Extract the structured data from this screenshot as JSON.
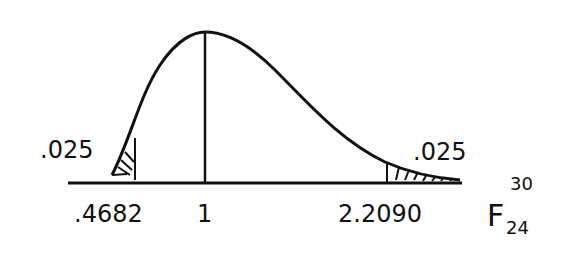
{
  "diagram": {
    "type": "F-distribution density sketch",
    "distribution": {
      "symbol": "F",
      "df_numerator": "30",
      "df_denominator": "24"
    },
    "tails": {
      "left": {
        "area_label": ".025",
        "critical_value_label": ".4682"
      },
      "right": {
        "area_label": ".025",
        "critical_value_label": "2.2090"
      }
    },
    "center_tick_label": "1",
    "colors": {
      "ink": "#111111",
      "background": "#ffffff"
    }
  }
}
